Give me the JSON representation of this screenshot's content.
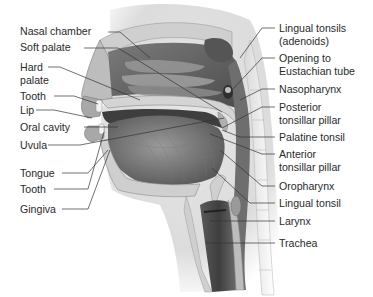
{
  "diagram": {
    "left_labels": [
      {
        "id": "nasal-chamber",
        "text": "Nasal chamber"
      },
      {
        "id": "soft-palate",
        "text": "Soft palate"
      },
      {
        "id": "hard-palate",
        "line1": "Hard",
        "line2": "palate"
      },
      {
        "id": "tooth-upper",
        "text": "Tooth"
      },
      {
        "id": "lip",
        "text": "Lip"
      },
      {
        "id": "oral-cavity",
        "text": "Oral cavity"
      },
      {
        "id": "uvula",
        "text": "Uvula"
      },
      {
        "id": "tongue",
        "text": "Tongue"
      },
      {
        "id": "tooth-lower",
        "text": "Tooth"
      },
      {
        "id": "gingiva",
        "text": "Gingiva"
      }
    ],
    "right_labels": [
      {
        "id": "lingual-tonsils-adenoids",
        "line1": "Lingual tonsils",
        "line2": "(adenoids)"
      },
      {
        "id": "opening-eustachian",
        "line1": "Opening to",
        "line2": "Eustachian tube"
      },
      {
        "id": "nasopharynx",
        "text": "Nasopharynx"
      },
      {
        "id": "posterior-tonsillar-pillar",
        "line1": "Posterior",
        "line2": "tonsillar pillar"
      },
      {
        "id": "palatine-tonsil",
        "text": "Palatine tonsil"
      },
      {
        "id": "anterior-tonsillar-pillar",
        "line1": "Anterior",
        "line2": "tonsillar pillar"
      },
      {
        "id": "oropharynx",
        "text": "Oropharynx"
      },
      {
        "id": "lingual-tonsil",
        "text": "Lingual tonsil"
      },
      {
        "id": "larynx",
        "text": "Larynx"
      },
      {
        "id": "trachea",
        "text": "Trachea"
      }
    ],
    "colors": {
      "text": "#2a2a2a",
      "leader": "#333333",
      "tissue_dark": "#4a4a4a",
      "tissue_mid": "#8c8c8c",
      "tissue_light": "#c8c8c8",
      "bone": "#d9d9d9",
      "background": "#ffffff"
    }
  }
}
